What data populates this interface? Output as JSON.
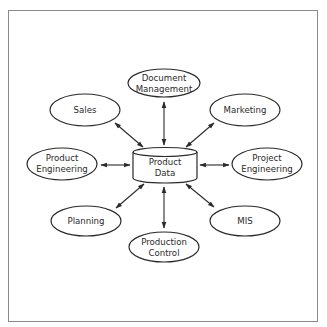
{
  "diagram": {
    "type": "hub-and-spoke",
    "hub": {
      "id": "product-data",
      "lines": [
        "Product",
        "Data"
      ],
      "shape": "cylinder"
    },
    "nodes": [
      {
        "id": "document-management",
        "lines": [
          "Document",
          "Management"
        ]
      },
      {
        "id": "sales",
        "lines": [
          "Sales"
        ]
      },
      {
        "id": "marketing",
        "lines": [
          "Marketing"
        ]
      },
      {
        "id": "product-engineering",
        "lines": [
          "Product",
          "Engineering"
        ]
      },
      {
        "id": "project-engineering",
        "lines": [
          "Project",
          "Engineering"
        ]
      },
      {
        "id": "planning",
        "lines": [
          "Planning"
        ]
      },
      {
        "id": "mis",
        "lines": [
          "MIS"
        ]
      },
      {
        "id": "production-control",
        "lines": [
          "Production",
          "Control"
        ]
      }
    ],
    "edges": [
      {
        "from": "product-data",
        "to": "document-management",
        "direction": "bidirectional"
      },
      {
        "from": "product-data",
        "to": "sales",
        "direction": "bidirectional"
      },
      {
        "from": "product-data",
        "to": "marketing",
        "direction": "bidirectional"
      },
      {
        "from": "product-data",
        "to": "product-engineering",
        "direction": "bidirectional"
      },
      {
        "from": "product-data",
        "to": "project-engineering",
        "direction": "bidirectional"
      },
      {
        "from": "product-data",
        "to": "planning",
        "direction": "bidirectional"
      },
      {
        "from": "product-data",
        "to": "mis",
        "direction": "bidirectional"
      },
      {
        "from": "product-data",
        "to": "production-control",
        "direction": "bidirectional"
      }
    ],
    "colors": {
      "stroke": "#2a2a2a",
      "frame": "#8a8a8a",
      "background": "#ffffff"
    }
  }
}
